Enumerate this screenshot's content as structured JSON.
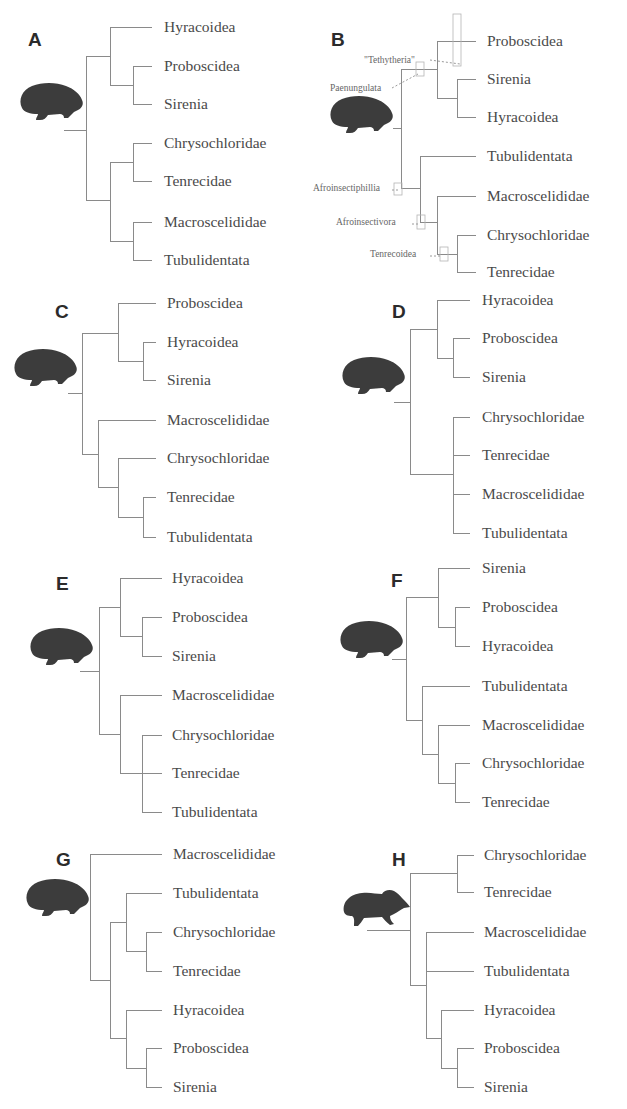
{
  "figure": {
    "colors": {
      "branch": "#8a8a8a",
      "text": "#4a4a4a",
      "silhouette": "#3c3c3c",
      "letter": "#2b2b2b"
    }
  },
  "panels": [
    {
      "id": "A",
      "letter": "A",
      "letter_pos": [
        28,
        46
      ],
      "icon": "hyrax",
      "icon_pos": [
        18,
        82
      ],
      "taxa": [
        "Hyracoidea",
        "Proboscidea",
        "Sirenia",
        "Chrysochloridae",
        "Tenrecidae",
        "Macroscelididae",
        "Tubulidentata"
      ],
      "leaf_x": 152,
      "label_x": 164,
      "leaf_y": [
        27,
        66,
        104,
        143,
        181,
        222,
        260
      ],
      "newick": "((Hyracoidea,(Proboscidea,Sirenia)),((Chrysochloridae,Tenrecidae),(Macroscelididae,Tubulidentata)))",
      "root_stem": [
        64,
        130
      ],
      "nodes": [
        {
          "x": 86,
          "y1": 56,
          "y2": 200
        },
        {
          "x": 110,
          "y1": 27,
          "y2": 85,
          "join_y": 56
        },
        {
          "x": 133,
          "y1": 66,
          "y2": 104,
          "join_y": 85
        },
        {
          "x": 110,
          "y1": 162,
          "y2": 241,
          "join_y": 200
        },
        {
          "x": 133,
          "y1": 143,
          "y2": 181,
          "join_y": 162
        },
        {
          "x": 133,
          "y1": 222,
          "y2": 260,
          "join_y": 241
        }
      ]
    },
    {
      "id": "B",
      "letter": "B",
      "letter_pos": [
        331,
        46
      ],
      "icon": "hyrax",
      "icon_pos": [
        328,
        95
      ],
      "taxa": [
        "Proboscidea",
        "Sirenia",
        "Hyracoidea",
        "Tubulidentata",
        "Macroscelididae",
        "Chrysochloridae",
        "Tenrecidae"
      ],
      "leaf_x": 476,
      "label_x": 487,
      "leaf_y": [
        41,
        79,
        117,
        156,
        196,
        235,
        272
      ],
      "newick": "(((Proboscidea,Sirenia),Hyracoidea),(Tubulidentata,(Macroscelididae,(Chrysochloridae,Tenrecidae))))",
      "root_stem": [
        393,
        128
      ],
      "nodes": [
        {
          "x": 401,
          "y1": 69,
          "y2": 188
        },
        {
          "x": 437,
          "y1": 41,
          "y2": 98,
          "join_y": 69
        },
        {
          "x": 457,
          "y1": 79,
          "y2": 117,
          "join_y": 98
        },
        {
          "x": 420,
          "y1": 156,
          "y2": 222,
          "join_y": 188
        },
        {
          "x": 437,
          "y1": 196,
          "y2": 254,
          "join_y": 222
        },
        {
          "x": 457,
          "y1": 235,
          "y2": 272,
          "join_y": 254
        }
      ],
      "clade_labels": [
        {
          "text": "\"Tethytheria\"",
          "x": 364,
          "y": 60
        },
        {
          "text": "Paenungulata",
          "x": 330,
          "y": 88
        },
        {
          "text": "Afroinsectiphillia",
          "x": 313,
          "y": 188
        },
        {
          "text": "Afroinsectivora",
          "x": 336,
          "y": 222
        },
        {
          "text": "Tenrecoidea",
          "x": 370,
          "y": 254
        }
      ]
    },
    {
      "id": "C",
      "letter": "C",
      "letter_pos": [
        55,
        318
      ],
      "icon": "hyrax",
      "icon_pos": [
        12,
        348
      ],
      "taxa": [
        "Proboscidea",
        "Hyracoidea",
        "Sirenia",
        "Macroscelididae",
        "Chrysochloridae",
        "Tenrecidae",
        "Tubulidentata"
      ],
      "leaf_x": 156,
      "label_x": 167,
      "leaf_y": [
        303,
        342,
        380,
        420,
        458,
        497,
        537
      ],
      "newick": "((Proboscidea,(Hyracoidea,Sirenia)),(Macroscelididae,(Chrysochloridae,(Tenrecidae,Tubulidentata))))",
      "root_stem": [
        68,
        393
      ],
      "nodes": [
        {
          "x": 82,
          "y1": 333,
          "y2": 454
        },
        {
          "x": 118,
          "y1": 303,
          "y2": 361,
          "join_y": 333
        },
        {
          "x": 143,
          "y1": 342,
          "y2": 380,
          "join_y": 361
        },
        {
          "x": 98,
          "y1": 420,
          "y2": 487,
          "join_y": 454
        },
        {
          "x": 118,
          "y1": 458,
          "y2": 517,
          "join_y": 487
        },
        {
          "x": 143,
          "y1": 497,
          "y2": 537,
          "join_y": 517
        }
      ]
    },
    {
      "id": "D",
      "letter": "D",
      "letter_pos": [
        392,
        318
      ],
      "icon": "hyrax",
      "icon_pos": [
        340,
        356
      ],
      "taxa": [
        "Hyracoidea",
        "Proboscidea",
        "Sirenia",
        "Chrysochloridae",
        "Tenrecidae",
        "Macroscelididae",
        "Tubulidentata"
      ],
      "leaf_x": 470,
      "label_x": 482,
      "leaf_y": [
        300,
        338,
        377,
        417,
        455,
        494,
        533
      ],
      "newick": "((Hyracoidea,(Proboscidea,Sirenia)),(Chrysochloridae,Tenrecidae,Macroscelididae,Tubulidentata))",
      "root_stem": [
        394,
        402
      ],
      "nodes": [
        {
          "x": 410,
          "y1": 329,
          "y2": 474
        },
        {
          "x": 437,
          "y1": 300,
          "y2": 358,
          "join_y": 329
        },
        {
          "x": 453,
          "y1": 338,
          "y2": 377,
          "join_y": 358
        },
        {
          "x": 453,
          "y1": 417,
          "y2": 533,
          "join_y": 474
        }
      ]
    },
    {
      "id": "E",
      "letter": "E",
      "letter_pos": [
        56,
        590
      ],
      "icon": "hyrax",
      "icon_pos": [
        28,
        627
      ],
      "taxa": [
        "Hyracoidea",
        "Proboscidea",
        "Sirenia",
        "Macroscelididae",
        "Chrysochloridae",
        "Tenrecidae",
        "Tubulidentata"
      ],
      "leaf_x": 162,
      "label_x": 172,
      "leaf_y": [
        578,
        617,
        656,
        695,
        735,
        773,
        812
      ],
      "newick": "((Hyracoidea,(Proboscidea,Sirenia)),(Macroscelididae,(Chrysochloridae,Tenrecidae,Tubulidentata)))",
      "root_stem": [
        80,
        671
      ],
      "nodes": [
        {
          "x": 99,
          "y1": 607,
          "y2": 734
        },
        {
          "x": 120,
          "y1": 578,
          "y2": 636,
          "join_y": 607
        },
        {
          "x": 142,
          "y1": 617,
          "y2": 656,
          "join_y": 636
        },
        {
          "x": 120,
          "y1": 695,
          "y2": 773,
          "join_y": 734
        },
        {
          "x": 142,
          "y1": 735,
          "y2": 812,
          "join_y": 773
        }
      ]
    },
    {
      "id": "F",
      "letter": "F",
      "letter_pos": [
        391,
        587
      ],
      "icon": "hyrax",
      "icon_pos": [
        338,
        620
      ],
      "taxa": [
        "Sirenia",
        "Proboscidea",
        "Hyracoidea",
        "Tubulidentata",
        "Macroscelididae",
        "Chrysochloridae",
        "Tenrecidae"
      ],
      "leaf_x": 470,
      "label_x": 482,
      "leaf_y": [
        568,
        607,
        646,
        686,
        725,
        763,
        802
      ],
      "newick": "((Sirenia,(Proboscidea,Hyracoidea)),(Tubulidentata,(Macroscelididae,(Chrysochloridae,Tenrecidae))))",
      "root_stem": [
        392,
        659
      ],
      "nodes": [
        {
          "x": 406,
          "y1": 597,
          "y2": 720
        },
        {
          "x": 438,
          "y1": 568,
          "y2": 627,
          "join_y": 597
        },
        {
          "x": 455,
          "y1": 607,
          "y2": 646,
          "join_y": 627
        },
        {
          "x": 422,
          "y1": 686,
          "y2": 754,
          "join_y": 720
        },
        {
          "x": 438,
          "y1": 725,
          "y2": 783,
          "join_y": 754
        },
        {
          "x": 455,
          "y1": 763,
          "y2": 802,
          "join_y": 783
        }
      ]
    },
    {
      "id": "G",
      "letter": "G",
      "letter_pos": [
        56,
        866
      ],
      "icon": "hyrax",
      "icon_pos": [
        24,
        878
      ],
      "taxa": [
        "Macroscelididae",
        "Tubulidentata",
        "Chrysochloridae",
        "Tenrecidae",
        "Hyracoidea",
        "Proboscidea",
        "Sirenia"
      ],
      "leaf_x": 162,
      "label_x": 173,
      "leaf_y": [
        854,
        893,
        932,
        971,
        1010,
        1048,
        1087
      ],
      "newick": "(Macroscelididae,((Tubulidentata,(Chrysochloridae,Tenrecidae)),(Hyracoidea,(Proboscidea,Sirenia))))",
      "root_stem": null,
      "nodes": [
        {
          "x": 90,
          "y1": 854,
          "y2": 980
        },
        {
          "x": 110,
          "y1": 922,
          "y2": 1038,
          "join_y": 980
        },
        {
          "x": 126,
          "y1": 893,
          "y2": 951,
          "join_y": 922
        },
        {
          "x": 146,
          "y1": 932,
          "y2": 971,
          "join_y": 951
        },
        {
          "x": 126,
          "y1": 1010,
          "y2": 1068,
          "join_y": 1038
        },
        {
          "x": 146,
          "y1": 1048,
          "y2": 1087,
          "join_y": 1068
        }
      ]
    },
    {
      "id": "H",
      "letter": "H",
      "letter_pos": [
        392,
        866
      ],
      "icon": "elephant-shrew",
      "icon_pos": [
        342,
        888
      ],
      "taxa": [
        "Chrysochloridae",
        "Tenrecidae",
        "Macroscelididae",
        "Tubulidentata",
        "Hyracoidea",
        "Proboscidea",
        "Sirenia"
      ],
      "leaf_x": 474,
      "label_x": 484,
      "leaf_y": [
        855,
        892,
        932,
        971,
        1010,
        1048,
        1087
      ],
      "newick": "((Chrysochloridae,Tenrecidae),(Macroscelididae,Tubulidentata,(Hyracoidea,(Proboscidea,Sirenia))))",
      "root_stem": [
        367,
        930
      ],
      "nodes": [
        {
          "x": 410,
          "y1": 873,
          "y2": 985
        },
        {
          "x": 457,
          "y1": 855,
          "y2": 892,
          "join_y": 873
        },
        {
          "x": 426,
          "y1": 932,
          "y2": 1038,
          "join_y": 985
        },
        {
          "x": 441,
          "y1": 1010,
          "y2": 1068,
          "join_y": 1038
        },
        {
          "x": 457,
          "y1": 1048,
          "y2": 1087,
          "join_y": 1068
        }
      ]
    }
  ]
}
